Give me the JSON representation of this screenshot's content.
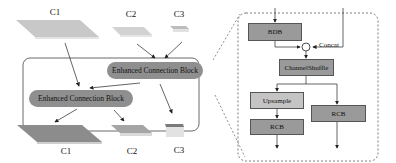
{
  "left_panel": {
    "inputs": [
      {
        "label": "C1",
        "color": "#c8c8c8"
      },
      {
        "label": "C2",
        "color": "#d2d2d2"
      },
      {
        "label": "C3",
        "color": "#bdbdbd"
      }
    ],
    "blocks": [
      {
        "label": "Enhanced Connection Block"
      },
      {
        "label": "Enhanced Connection Block"
      }
    ],
    "outputs": [
      {
        "label": "C1",
        "color": "#8c8c8c"
      },
      {
        "label": "C2",
        "color": "#a5a5a5"
      },
      {
        "label": "C3",
        "color": "#7a7a7a"
      }
    ]
  },
  "right_panel": {
    "bdb": "BDB",
    "concat": "Concat",
    "channel_shuffle": "ChannelShuffle",
    "upsample": "Upsample",
    "rcb_left": "RCB",
    "rcb_right": "RCB"
  },
  "colors": {
    "block_fill": "#8f8f8f",
    "dark_box": "#9a9a9a",
    "light_box": "#c4c4c4",
    "line": "#333333"
  }
}
